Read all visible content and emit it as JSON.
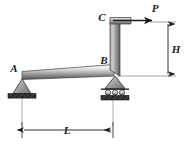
{
  "figure": {
    "type": "structural-free-body-diagram",
    "background_color": "#ffffff",
    "line_color": "#1a1a1a",
    "member_light": "#f2f2f2",
    "member_mid": "#b9b9b9",
    "member_dark": "#4a4a4a"
  },
  "joints": {
    "a": {
      "label": "A",
      "support_type": "pin-support",
      "x": 22,
      "y": 76
    },
    "b": {
      "label": "B",
      "support_type": "roller-support",
      "x": 113,
      "y": 76
    },
    "c": {
      "label": "C",
      "support_type": "free-end",
      "x": 113,
      "y": 22
    }
  },
  "load": {
    "label": "P",
    "direction": "right",
    "applied_at": "C",
    "arrow_from_x": 113,
    "arrow_to_x": 152,
    "arrow_y": 22
  },
  "dimensions": {
    "height": {
      "label": "H",
      "orientation": "vertical",
      "from": "B",
      "to": "C",
      "x": 166,
      "y_top": 22,
      "y_bottom": 76
    },
    "span": {
      "label": "L",
      "orientation": "horizontal",
      "from": "A",
      "to": "B",
      "y": 130,
      "x_left": 22,
      "x_right": 113
    }
  },
  "icons": {
    "pin_support": "pin-support-icon",
    "roller_support": "roller-support-icon",
    "force_arrow": "force-arrow-icon",
    "dimension_arrow": "dimension-arrow-icon"
  }
}
